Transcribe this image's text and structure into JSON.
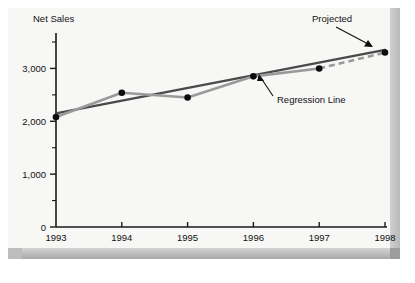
{
  "chart_data": {
    "type": "line",
    "title": "",
    "ylabel": "Net Sales",
    "xlabel": "",
    "categories": [
      "1993",
      "1994",
      "1995",
      "1996",
      "1997",
      "1998"
    ],
    "x": [
      1993,
      1994,
      1995,
      1996,
      1997,
      1998
    ],
    "ylim": [
      0,
      3500
    ],
    "xlim": [
      1993,
      1998
    ],
    "grid": false,
    "legend": "none",
    "y_ticks_major": [
      "0",
      "1,000",
      "2,000",
      "3,000"
    ],
    "y_tick_values_major": [
      0,
      1000,
      2000,
      3000
    ],
    "y_tick_values_minor": [
      500,
      1500,
      2500,
      3500
    ],
    "series": [
      {
        "name": "Net Sales",
        "style": "solid-gray-with-markers",
        "color": "#9a9a9a",
        "values": [
          2080,
          2540,
          2450,
          2850,
          3000,
          3300
        ]
      },
      {
        "name": "Regression Line",
        "style": "solid-dark",
        "color": "#4a4a4a",
        "values": [
          2150,
          2390,
          2630,
          2870,
          3110,
          3350
        ]
      }
    ],
    "projected_segment": {
      "from_x": 1997,
      "to_x": 1998,
      "from_value": 3000,
      "to_value": 3300,
      "style": "dashed"
    },
    "annotations": [
      {
        "id": "projected",
        "label": "Projected",
        "points_to_x": 1998,
        "points_to_value": 3300
      },
      {
        "id": "regression-line",
        "label": "Regression Line",
        "points_to_x": 1996.6,
        "points_to_value": 2960
      }
    ],
    "colors": {
      "series_line": "#9a9a9a",
      "regression_line": "#4a4a4a",
      "marker": "#0d0d0d",
      "axis": "#1a1a1a",
      "plot_background": "#f7f7f5",
      "frame_shadow": "#a9a9a9"
    }
  }
}
